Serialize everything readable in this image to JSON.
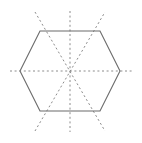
{
  "figure": {
    "canvas": {
      "width": 142,
      "height": 143,
      "background": "#ffffff"
    },
    "colors": {
      "outline": "#6b6b6b",
      "axis": "#8c8c8c",
      "background": "#ffffff"
    },
    "shape": {
      "name": "regular-hexagon",
      "orientation": "flat-top",
      "center": {
        "x": 70,
        "y": 71
      },
      "circumradius": 50,
      "stroke_width": 1.1,
      "vertices": [
        {
          "label": "top-left",
          "x": 40,
          "y": 31
        },
        {
          "label": "top-right",
          "x": 100,
          "y": 31
        },
        {
          "label": "right",
          "x": 120,
          "y": 71
        },
        {
          "label": "bottom-right",
          "x": 100,
          "y": 111
        },
        {
          "label": "bottom-left",
          "x": 40,
          "y": 111
        },
        {
          "label": "left",
          "x": 20,
          "y": 71
        }
      ]
    },
    "axes": {
      "count": 4,
      "dash_pattern": "2 2.6",
      "stroke_width": 1.0,
      "lines": [
        {
          "name": "horizontal-axis",
          "type": "vertex-to-vertex",
          "angle_deg": 0,
          "x1": 10,
          "y1": 71,
          "x2": 132,
          "y2": 71
        },
        {
          "name": "vertical-axis",
          "type": "edge-to-edge",
          "angle_deg": 90,
          "x1": 70,
          "y1": 11,
          "x2": 70,
          "y2": 132
        },
        {
          "name": "diagonal-axis-up-right",
          "type": "vertex-to-vertex",
          "angle_deg": 60,
          "x1": 35,
          "y1": 131,
          "x2": 105,
          "y2": 12
        },
        {
          "name": "diagonal-axis-up-left",
          "type": "vertex-to-vertex",
          "angle_deg": 120,
          "x1": 35,
          "y1": 12,
          "x2": 105,
          "y2": 131
        }
      ]
    }
  }
}
